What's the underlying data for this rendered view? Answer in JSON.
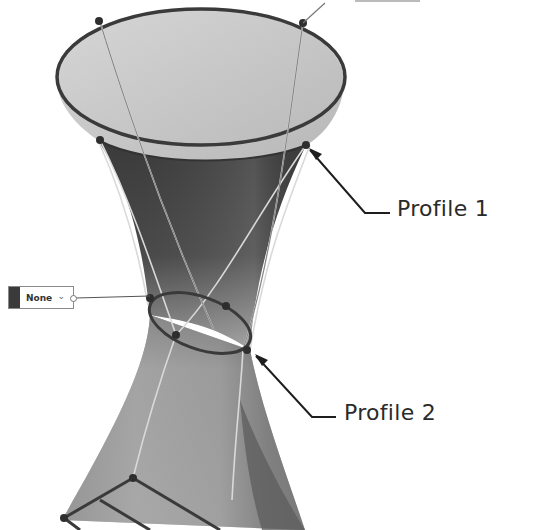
{
  "figure": {
    "colors": {
      "background": "#ffffff",
      "surface_inner_light": "#c9c9c9",
      "surface_dark": "#3e3e3e",
      "surface_mid": "#8f8f8f",
      "profile_curve": "#3a3a3a",
      "guide_lines": "#d8d8d8",
      "callout_text": "#2a2a2a",
      "leader_line": "#1e1e1e"
    }
  },
  "callouts": [
    {
      "id": "profile-1",
      "label": "Profile 1"
    },
    {
      "id": "profile-2",
      "label": "Profile 2"
    }
  ],
  "widgets": {
    "mapping_dropdown": {
      "value": "None",
      "icon": "chevron-down-icon"
    }
  }
}
